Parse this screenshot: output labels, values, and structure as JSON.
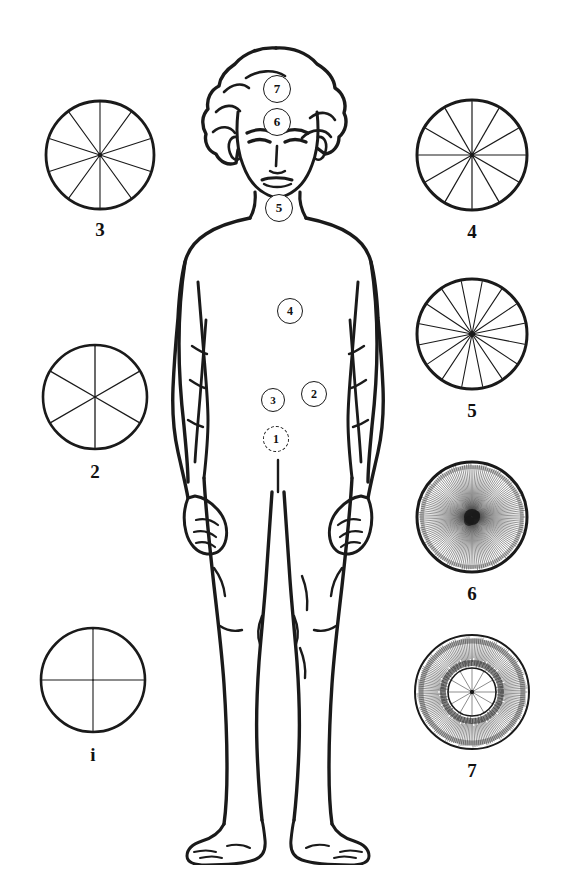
{
  "figure": {
    "background_color": "#ffffff",
    "ink_color": "#1a1a1a"
  },
  "body_markers": [
    {
      "id": "marker-1",
      "label": "1",
      "x": 125,
      "y": 418,
      "r": 12,
      "style": "dashed",
      "region": "base-of-spine"
    },
    {
      "id": "marker-2",
      "label": "2",
      "x": 163,
      "y": 373,
      "r": 12,
      "style": "solid",
      "region": "lower-abdomen-right"
    },
    {
      "id": "marker-3",
      "label": "3",
      "x": 122,
      "y": 379,
      "r": 12,
      "style": "solid",
      "region": "solar-plexus"
    },
    {
      "id": "marker-4",
      "label": "4",
      "x": 139,
      "y": 290,
      "r": 12,
      "style": "solid",
      "region": "heart"
    },
    {
      "id": "marker-5",
      "label": "5",
      "x": 128,
      "y": 187,
      "r": 13,
      "style": "solid",
      "region": "throat"
    },
    {
      "id": "marker-6",
      "label": "6",
      "x": 126,
      "y": 101,
      "r": 13,
      "style": "solid",
      "region": "brow"
    },
    {
      "id": "marker-7",
      "label": "7",
      "x": 126,
      "y": 68,
      "r": 13,
      "style": "solid",
      "region": "crown"
    }
  ],
  "wheels": [
    {
      "id": "wheel-1",
      "label": "i",
      "spokes": 4,
      "radius": 52,
      "rim_width": 2.6,
      "spoke_width": 1.1,
      "hub": "none",
      "rotation": 0,
      "outer_fringe": 0,
      "inner_ring": 0,
      "left": 33,
      "top": 620,
      "box": 120
    },
    {
      "id": "wheel-2",
      "label": "2",
      "spokes": 6,
      "radius": 52,
      "rim_width": 2.6,
      "spoke_width": 1.3,
      "hub": "none",
      "rotation": 0,
      "outer_fringe": 0,
      "inner_ring": 0,
      "left": 35,
      "top": 337,
      "box": 120
    },
    {
      "id": "wheel-3",
      "label": "3",
      "spokes": 10,
      "radius": 54,
      "rim_width": 2.8,
      "spoke_width": 1.1,
      "hub": "dot",
      "rotation": 0,
      "outer_fringe": 0,
      "inner_ring": 0,
      "left": 40,
      "top": 95,
      "box": 120
    },
    {
      "id": "wheel-4",
      "label": "4",
      "spokes": 12,
      "radius": 55,
      "rim_width": 3.0,
      "spoke_width": 1.2,
      "hub": "dot",
      "rotation": 0,
      "outer_fringe": 0,
      "inner_ring": 0,
      "left": 410,
      "top": 93,
      "box": 124
    },
    {
      "id": "wheel-5",
      "label": "5",
      "spokes": 16,
      "radius": 55,
      "rim_width": 3.0,
      "spoke_width": 1.1,
      "hub": "dot",
      "rotation": 11,
      "outer_fringe": 0,
      "inner_ring": 0,
      "left": 410,
      "top": 272,
      "box": 124
    },
    {
      "id": "wheel-6",
      "label": "6",
      "spokes": 0,
      "radius": 55,
      "rim_width": 3.0,
      "spoke_width": 0.5,
      "hub": "blob",
      "rotation": 0,
      "outer_fringe": 150,
      "inner_ring": 0,
      "left": 410,
      "top": 455,
      "box": 124
    },
    {
      "id": "wheel-7",
      "label": "7",
      "spokes": 12,
      "radius": 57,
      "rim_width": 2.0,
      "spoke_width": 0.5,
      "hub": "dot",
      "rotation": 0,
      "outer_fringe": 170,
      "inner_ring": 24,
      "left": 408,
      "top": 628,
      "box": 128
    }
  ]
}
